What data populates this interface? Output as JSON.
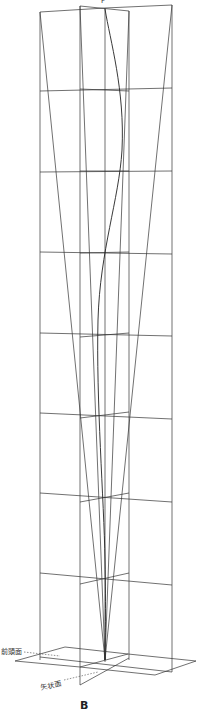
{
  "diagram": {
    "top_label": "F",
    "planes": {
      "frontal": "前頭面",
      "sagittal": "矢状面"
    },
    "figure_label": "B",
    "line_color": "#333333"
  }
}
